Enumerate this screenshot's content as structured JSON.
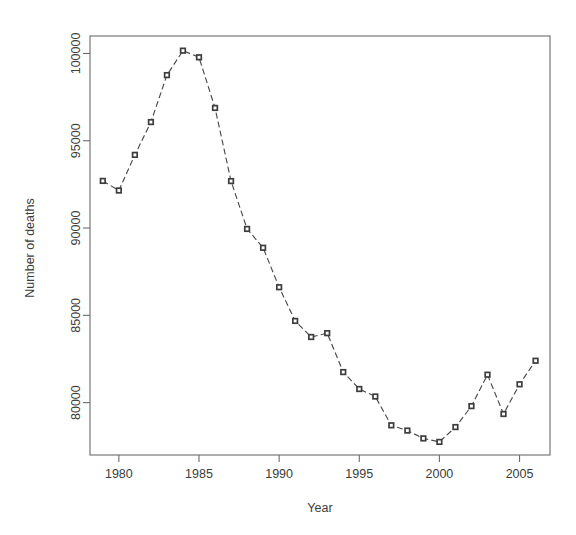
{
  "chart_data": {
    "type": "line",
    "title": "",
    "subtitle": "",
    "xlabel": "Year",
    "ylabel": "Number of deaths",
    "x": [
      1979,
      1980,
      1981,
      1982,
      1983,
      1984,
      1985,
      1986,
      1987,
      1988,
      1989,
      1990,
      1991,
      1992,
      1993,
      1994,
      1995,
      1996,
      1997,
      1998,
      1999,
      2000,
      2001,
      2002,
      2003,
      2004,
      2005,
      2006
    ],
    "values": [
      92700,
      92150,
      94190,
      96070,
      98760,
      100160,
      99780,
      96880,
      92690,
      89950,
      88870,
      86610,
      84680,
      83760,
      83980,
      81750,
      80780,
      80350,
      78700,
      78400,
      77950,
      77750,
      78600,
      79800,
      81600,
      79350,
      81050,
      82400
    ],
    "series": [
      {
        "name": "Number of deaths",
        "values": [
          92700,
          92150,
          94190,
          96070,
          98760,
          100160,
          99780,
          96880,
          92690,
          89950,
          88870,
          86610,
          84680,
          83760,
          83980,
          81750,
          80780,
          80350,
          78700,
          78400,
          77950,
          77750,
          78600,
          79800,
          81600,
          79350,
          81050,
          82400
        ]
      }
    ],
    "xlim": [
      1978.2,
      2006.9
    ],
    "ylim": [
      77000,
      101000
    ],
    "xticks": [
      1980,
      1985,
      1990,
      1995,
      2000,
      2005
    ],
    "xtick_labels": [
      "1980",
      "1985",
      "1990",
      "1995",
      "2000",
      "2005"
    ],
    "yticks": [
      80000,
      85000,
      90000,
      95000,
      100000
    ],
    "ytick_labels": [
      "80000",
      "85000",
      "90000",
      "95000",
      "100000"
    ],
    "grid": false,
    "legend": null,
    "legend_position": "none",
    "marker": "square",
    "line_style": "dashed",
    "line_color": "#4a4a4a",
    "marker_fill": "#ffffff",
    "marker_stroke": "#3d3d3d",
    "axis_color": "#6b6b6b",
    "background": "#ffffff",
    "annotations": []
  },
  "figure": {
    "x_axis_title": "Year",
    "y_axis_title": "Number of deaths"
  }
}
